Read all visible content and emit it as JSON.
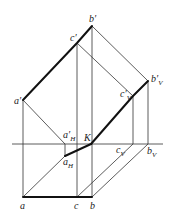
{
  "diagram": {
    "type": "descriptive-geometry-projection",
    "labels": {
      "b_prime": {
        "base": "b",
        "mark": "′",
        "sub": ""
      },
      "c_prime": {
        "base": "c",
        "mark": "′",
        "sub": ""
      },
      "a_prime": {
        "base": "a",
        "mark": "′",
        "sub": ""
      },
      "b_prime_V": {
        "base": "b",
        "mark": "′",
        "sub": "V"
      },
      "c_prime_V": {
        "base": "c",
        "mark": "′",
        "sub": "V"
      },
      "a_prime_H": {
        "base": "a",
        "mark": "′",
        "sub": "H"
      },
      "K": {
        "base": "K",
        "mark": "",
        "sub": ""
      },
      "a_H": {
        "base": "a",
        "mark": "",
        "sub": "H"
      },
      "c_V": {
        "base": "c",
        "mark": "",
        "sub": "V"
      },
      "b_V": {
        "base": "b",
        "mark": "",
        "sub": "V"
      },
      "a": {
        "base": "a",
        "mark": "",
        "sub": ""
      },
      "c": {
        "base": "c",
        "mark": "",
        "sub": ""
      },
      "b": {
        "base": "b",
        "mark": "",
        "sub": ""
      }
    },
    "colors": {
      "line": "#333333",
      "thick_line": "#111111",
      "text": "#222222"
    }
  }
}
